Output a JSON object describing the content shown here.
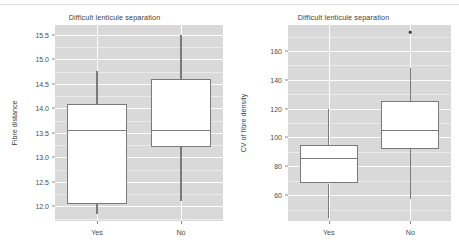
{
  "chart_data": [
    {
      "type": "box",
      "panel": "left",
      "title": "Difficult lenticule separation",
      "xlabel": "",
      "ylabel": "Fibre distance",
      "categories": [
        "Yes",
        "No"
      ],
      "ylim": [
        11.7,
        15.7
      ],
      "yticks": [
        12.0,
        12.5,
        13.0,
        13.5,
        14.0,
        14.5,
        15.0,
        15.5
      ],
      "ytick_labels": [
        "12.0",
        "12.5",
        "13.0",
        "13.5",
        "14.0",
        "14.5",
        "15.0",
        "15.5"
      ],
      "grid": true,
      "legend": "none",
      "boxes": [
        {
          "category": "Yes",
          "whisker_low": 11.84,
          "q1": 12.05,
          "median": 13.55,
          "q3": 14.08,
          "whisker_high": 14.76,
          "outliers": []
        },
        {
          "category": "No",
          "whisker_low": 12.1,
          "q1": 13.21,
          "median": 13.56,
          "q3": 14.6,
          "whisker_high": 15.5,
          "outliers": []
        }
      ]
    },
    {
      "type": "box",
      "panel": "right",
      "title": "Difficult lenticule separation",
      "xlabel": "",
      "ylabel": "CV of fibre density",
      "categories": [
        "Yes",
        "No"
      ],
      "ylim": [
        42,
        178
      ],
      "yticks": [
        60,
        80,
        100,
        120,
        140,
        160
      ],
      "ytick_labels": [
        "60",
        "80",
        "100",
        "120",
        "140",
        "160"
      ],
      "grid": true,
      "legend": "none",
      "boxes": [
        {
          "category": "Yes",
          "whisker_low": 44,
          "q1": 68,
          "median": 86,
          "q3": 95,
          "whisker_high": 120,
          "outliers": []
        },
        {
          "category": "No",
          "whisker_low": 57,
          "q1": 92,
          "median": 105,
          "q3": 125,
          "whisker_high": 148,
          "outliers": [
            173
          ]
        }
      ]
    }
  ],
  "colors": {
    "panel_background": "#d9d9d9",
    "gridline": "#ffffff",
    "box_stroke": "#7a7a7a",
    "box_fill": "#ffffff",
    "text": "#3d3d3d",
    "outlier": "#3a3a3a"
  }
}
